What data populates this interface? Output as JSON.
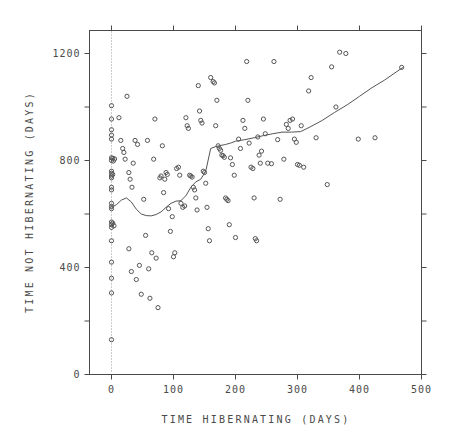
{
  "chart_data": {
    "type": "scatter",
    "title": "",
    "xlabel": "TIME HIBERNATING (DAYS)",
    "ylabel": "TIME NOT HIBERNATING (DAYS)",
    "xlim": [
      -20,
      500
    ],
    "ylim": [
      0,
      1280
    ],
    "xticks": [
      0,
      100,
      200,
      300,
      400,
      500
    ],
    "xticklabels": [
      "0",
      "100",
      "200",
      "300",
      "400",
      "500"
    ],
    "yticks": [
      0,
      200,
      400,
      600,
      800,
      1000,
      1200
    ],
    "yticklabels": [
      "0",
      "",
      "400",
      "",
      "800",
      "",
      "1200"
    ],
    "grid": false,
    "legend": null,
    "marker": "open-circle",
    "reference_line": {
      "orientation": "vertical",
      "x": 0,
      "style": "dotted"
    },
    "points": [
      [
        0,
        1005
      ],
      [
        0,
        955
      ],
      [
        0,
        915
      ],
      [
        0,
        895
      ],
      [
        0,
        880
      ],
      [
        0,
        810
      ],
      [
        2,
        808
      ],
      [
        5,
        806
      ],
      [
        0,
        800
      ],
      [
        3,
        798
      ],
      [
        0,
        760
      ],
      [
        0,
        752
      ],
      [
        2,
        748
      ],
      [
        0,
        742
      ],
      [
        0,
        735
      ],
      [
        0,
        700
      ],
      [
        0,
        690
      ],
      [
        0,
        640
      ],
      [
        0,
        628
      ],
      [
        0,
        620
      ],
      [
        0,
        570
      ],
      [
        2,
        566
      ],
      [
        0,
        560
      ],
      [
        4,
        556
      ],
      [
        0,
        550
      ],
      [
        0,
        500
      ],
      [
        0,
        420
      ],
      [
        0,
        360
      ],
      [
        0,
        305
      ],
      [
        0,
        130
      ],
      [
        12,
        960
      ],
      [
        15,
        875
      ],
      [
        18,
        845
      ],
      [
        20,
        830
      ],
      [
        22,
        805
      ],
      [
        25,
        1040
      ],
      [
        28,
        755
      ],
      [
        30,
        730
      ],
      [
        33,
        700
      ],
      [
        35,
        790
      ],
      [
        28,
        470
      ],
      [
        32,
        385
      ],
      [
        38,
        875
      ],
      [
        42,
        860
      ],
      [
        45,
        408
      ],
      [
        40,
        355
      ],
      [
        48,
        300
      ],
      [
        52,
        655
      ],
      [
        55,
        520
      ],
      [
        58,
        875
      ],
      [
        60,
        395
      ],
      [
        62,
        285
      ],
      [
        65,
        455
      ],
      [
        68,
        805
      ],
      [
        70,
        955
      ],
      [
        72,
        435
      ],
      [
        75,
        250
      ],
      [
        78,
        735
      ],
      [
        80,
        742
      ],
      [
        82,
        855
      ],
      [
        84,
        680
      ],
      [
        86,
        730
      ],
      [
        88,
        755
      ],
      [
        90,
        748
      ],
      [
        92,
        620
      ],
      [
        95,
        535
      ],
      [
        98,
        590
      ],
      [
        100,
        440
      ],
      [
        102,
        455
      ],
      [
        105,
        770
      ],
      [
        108,
        775
      ],
      [
        110,
        745
      ],
      [
        112,
        640
      ],
      [
        115,
        625
      ],
      [
        118,
        630
      ],
      [
        120,
        960
      ],
      [
        122,
        930
      ],
      [
        124,
        920
      ],
      [
        126,
        745
      ],
      [
        128,
        742
      ],
      [
        130,
        738
      ],
      [
        132,
        700
      ],
      [
        134,
        690
      ],
      [
        136,
        660
      ],
      [
        138,
        615
      ],
      [
        140,
        1080
      ],
      [
        142,
        985
      ],
      [
        144,
        950
      ],
      [
        146,
        940
      ],
      [
        148,
        760
      ],
      [
        150,
        755
      ],
      [
        152,
        715
      ],
      [
        154,
        625
      ],
      [
        156,
        545
      ],
      [
        158,
        500
      ],
      [
        160,
        1110
      ],
      [
        164,
        1095
      ],
      [
        166,
        1090
      ],
      [
        168,
        930
      ],
      [
        170,
        1025
      ],
      [
        172,
        855
      ],
      [
        174,
        845
      ],
      [
        176,
        838
      ],
      [
        178,
        820
      ],
      [
        180,
        818
      ],
      [
        182,
        812
      ],
      [
        184,
        660
      ],
      [
        186,
        655
      ],
      [
        188,
        650
      ],
      [
        190,
        560
      ],
      [
        192,
        810
      ],
      [
        195,
        785
      ],
      [
        198,
        745
      ],
      [
        200,
        512
      ],
      [
        205,
        880
      ],
      [
        208,
        845
      ],
      [
        212,
        950
      ],
      [
        215,
        920
      ],
      [
        218,
        1170
      ],
      [
        220,
        1025
      ],
      [
        222,
        865
      ],
      [
        225,
        775
      ],
      [
        228,
        770
      ],
      [
        230,
        660
      ],
      [
        232,
        508
      ],
      [
        234,
        500
      ],
      [
        236,
        888
      ],
      [
        238,
        820
      ],
      [
        240,
        790
      ],
      [
        242,
        835
      ],
      [
        245,
        955
      ],
      [
        248,
        900
      ],
      [
        252,
        790
      ],
      [
        258,
        788
      ],
      [
        262,
        1170
      ],
      [
        268,
        878
      ],
      [
        272,
        655
      ],
      [
        278,
        805
      ],
      [
        282,
        935
      ],
      [
        285,
        920
      ],
      [
        288,
        950
      ],
      [
        292,
        955
      ],
      [
        295,
        880
      ],
      [
        298,
        868
      ],
      [
        300,
        785
      ],
      [
        303,
        782
      ],
      [
        306,
        930
      ],
      [
        310,
        775
      ],
      [
        318,
        1060
      ],
      [
        322,
        1110
      ],
      [
        330,
        885
      ],
      [
        348,
        710
      ],
      [
        355,
        1150
      ],
      [
        362,
        1000
      ],
      [
        368,
        1205
      ],
      [
        378,
        1200
      ],
      [
        398,
        880
      ],
      [
        425,
        885
      ],
      [
        468,
        1148
      ]
    ],
    "trend_line": {
      "name": "smoothed-fit",
      "x": [
        0,
        8,
        16,
        24,
        32,
        40,
        48,
        56,
        64,
        72,
        80,
        88,
        96,
        104,
        112,
        120,
        128,
        136,
        144,
        152,
        160,
        168,
        176,
        184,
        192,
        200,
        215,
        230,
        245,
        260,
        275,
        290,
        305,
        320,
        340,
        360,
        380,
        400,
        420,
        440,
        470
      ],
      "y": [
        625,
        635,
        652,
        660,
        645,
        618,
        600,
        594,
        593,
        598,
        608,
        625,
        640,
        648,
        650,
        668,
        700,
        720,
        730,
        760,
        845,
        852,
        856,
        860,
        865,
        872,
        878,
        885,
        893,
        900,
        906,
        906,
        908,
        925,
        950,
        980,
        1008,
        1040,
        1072,
        1100,
        1148
      ]
    }
  },
  "axes": {
    "x_title": "TIME HIBERNATING (DAYS)",
    "y_title": "TIME NOT HIBERNATING (DAYS)"
  },
  "colors": {
    "axis": "#4a4a4a",
    "marker": "#555555",
    "line": "#555555",
    "refline": "#999999",
    "background": "#ffffff"
  }
}
